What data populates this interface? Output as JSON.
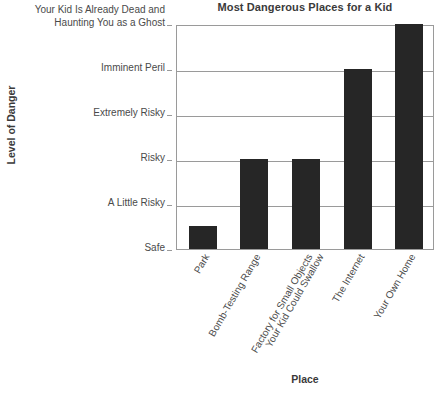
{
  "chart_data": {
    "type": "bar",
    "title": "Most Dangerous Places for a Kid",
    "xlabel": "Place",
    "ylabel": "Level of Danger",
    "categories": [
      "Park",
      "Bomb-Testing Range",
      "Factory for Small Objects Your Kid Could Swallow",
      "The Internet",
      "Your Own Home"
    ],
    "category_lines": [
      [
        "Park"
      ],
      [
        "Bomb-Testing Range"
      ],
      [
        "Factory for Small Objects",
        "Your Kid Could Swallow"
      ],
      [
        "The Internet"
      ],
      [
        "Your Own Home"
      ]
    ],
    "values": [
      0.5,
      2,
      2,
      4,
      5
    ],
    "ytick_labels": [
      "Safe",
      "A Little Risky",
      "Risky",
      "Extremely Risky",
      "Imminent Peril",
      "Your Kid Is Already Dead and Haunting You as a Ghost"
    ],
    "ytick_label_lines": [
      [
        "Safe"
      ],
      [
        "A Little Risky"
      ],
      [
        "Risky"
      ],
      [
        "Extremely Risky"
      ],
      [
        "Imminent Peril"
      ],
      [
        "Your Kid Is Already Dead and",
        "Haunting You as a Ghost"
      ]
    ],
    "ytick_values": [
      0,
      1,
      2,
      3,
      4,
      5
    ],
    "ylim": [
      0,
      5
    ],
    "grid": true,
    "legend": false,
    "bar_color": "#262626",
    "axis_color": "#9a9a9a",
    "text_color": "#4a4a4a",
    "title_color": "#3a3a3a"
  }
}
